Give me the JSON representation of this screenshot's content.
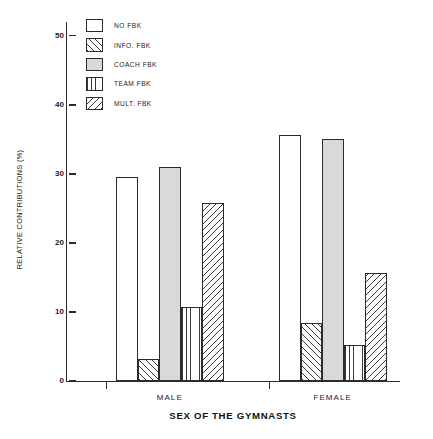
{
  "chart_data": {
    "type": "bar",
    "title": "",
    "subtitle": "",
    "xlabel": "SEX OF THE GYMNASTS",
    "ylabel": "RELATIVE CONTRIBUTIONS (%)",
    "categories": [
      "MALE",
      "FEMALE"
    ],
    "ylim": [
      0,
      52
    ],
    "yticks": [
      0,
      10,
      20,
      30,
      40,
      50
    ],
    "ytick_labels": [
      "0",
      "10",
      "20",
      "30",
      "40",
      "50"
    ],
    "grid": false,
    "legend_position": "top-left",
    "series": [
      {
        "name": "NO FBK",
        "pattern": "empty",
        "values": [
          29.5,
          35.6
        ]
      },
      {
        "name": "INFO. FBK",
        "pattern": "diagonal-fwd",
        "values": [
          3.2,
          8.4
        ]
      },
      {
        "name": "COACH FBK",
        "pattern": "solid-gray",
        "values": [
          31.0,
          35.1
        ]
      },
      {
        "name": "TEAM FBK",
        "pattern": "vertical",
        "values": [
          10.7,
          5.2
        ]
      },
      {
        "name": "MULT. FBK",
        "pattern": "diagonal-back",
        "values": [
          25.8,
          15.6
        ]
      }
    ],
    "colors": {
      "axis": "#2b2b2b",
      "hatch": "#3a3a3a",
      "solid_fill": "#d9d9d9",
      "empty_fill": "#ffffff",
      "background": "#ffffff"
    }
  }
}
